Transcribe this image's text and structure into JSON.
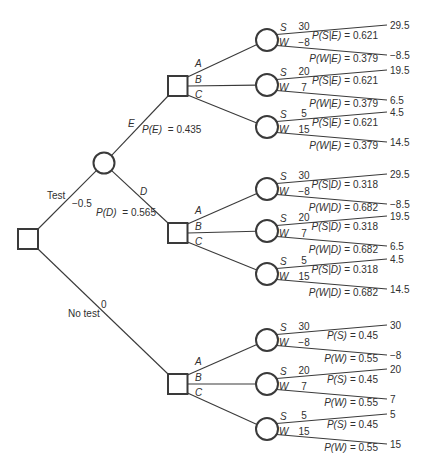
{
  "figure": {
    "test_branch": {
      "label": "Test",
      "value": "−0.5"
    },
    "no_test_branch": {
      "label": "No test",
      "value": "0"
    },
    "test_chance": {
      "E": {
        "label": "E",
        "prob_expr": "P(E)",
        "prob_value": "= 0.435"
      },
      "D": {
        "label": "D",
        "prob_expr": "P(D)",
        "prob_value": "= 0.565"
      }
    },
    "decision_groups": [
      {
        "alternatives": [
          {
            "label": "A",
            "states": [
              {
                "label": "S",
                "payoff": "30",
                "prob_expr": "P(S|E)",
                "prob_value": "= 0.621",
                "result": "29.5"
              },
              {
                "label": "W",
                "payoff": "−8",
                "prob_expr": "P(W|E)",
                "prob_value": "= 0.379",
                "result": "−8.5"
              }
            ]
          },
          {
            "label": "B",
            "states": [
              {
                "label": "S",
                "payoff": "20",
                "prob_expr": "P(S|E)",
                "prob_value": "= 0.621",
                "result": "19.5"
              },
              {
                "label": "W",
                "payoff": "7",
                "prob_expr": "P(W|E)",
                "prob_value": "= 0.379",
                "result": "6.5"
              }
            ]
          },
          {
            "label": "C",
            "states": [
              {
                "label": "S",
                "payoff": "5",
                "prob_expr": "P(S|E)",
                "prob_value": "= 0.621",
                "result": "4.5"
              },
              {
                "label": "W",
                "payoff": "15",
                "prob_expr": "P(W|E)",
                "prob_value": "= 0.379",
                "result": "14.5"
              }
            ]
          }
        ]
      },
      {
        "alternatives": [
          {
            "label": "A",
            "states": [
              {
                "label": "S",
                "payoff": "30",
                "prob_expr": "P(S|D)",
                "prob_value": "= 0.318",
                "result": "29.5"
              },
              {
                "label": "W",
                "payoff": "−8",
                "prob_expr": "P(W|D)",
                "prob_value": "= 0.682",
                "result": "−8.5"
              }
            ]
          },
          {
            "label": "B",
            "states": [
              {
                "label": "S",
                "payoff": "20",
                "prob_expr": "P(S|D)",
                "prob_value": "= 0.318",
                "result": "19.5"
              },
              {
                "label": "W",
                "payoff": "7",
                "prob_expr": "P(W|D)",
                "prob_value": "= 0.682",
                "result": "6.5"
              }
            ]
          },
          {
            "label": "C",
            "states": [
              {
                "label": "S",
                "payoff": "5",
                "prob_expr": "P(S|D)",
                "prob_value": "= 0.318",
                "result": "4.5"
              },
              {
                "label": "W",
                "payoff": "15",
                "prob_expr": "P(W|D)",
                "prob_value": "= 0.682",
                "result": "14.5"
              }
            ]
          }
        ]
      },
      {
        "alternatives": [
          {
            "label": "A",
            "states": [
              {
                "label": "S",
                "payoff": "30",
                "prob_expr": "P(S)",
                "prob_value": "= 0.45",
                "result": "30"
              },
              {
                "label": "W",
                "payoff": "−8",
                "prob_expr": "P(W)",
                "prob_value": "= 0.55",
                "result": "−8"
              }
            ]
          },
          {
            "label": "B",
            "states": [
              {
                "label": "S",
                "payoff": "20",
                "prob_expr": "P(S)",
                "prob_value": "= 0.45",
                "result": "20"
              },
              {
                "label": "W",
                "payoff": "7",
                "prob_expr": "P(W)",
                "prob_value": "= 0.55",
                "result": "7"
              }
            ]
          },
          {
            "label": "C",
            "states": [
              {
                "label": "S",
                "payoff": "5",
                "prob_expr": "P(S)",
                "prob_value": "= 0.45",
                "result": "5"
              },
              {
                "label": "W",
                "payoff": "15",
                "prob_expr": "P(W)",
                "prob_value": "= 0.55",
                "result": "15"
              }
            ]
          }
        ]
      }
    ]
  }
}
